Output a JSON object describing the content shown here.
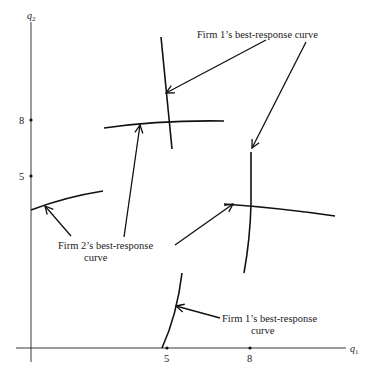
{
  "figure": {
    "axes": {
      "x_label": "q",
      "x_label_sub": "1",
      "y_label": "q",
      "y_label_sub": "2",
      "x_ticks": [
        "5",
        "8"
      ],
      "y_ticks": [
        "8",
        "5"
      ]
    },
    "annotations": {
      "firm1_top": "Firm 1’s best-response curve",
      "firm2_line1": "Firm 2’s best-response",
      "firm2_line2": "curve",
      "firm1_bottom_line1": "Firm 1’s best-response",
      "firm1_bottom_line2": "curve"
    },
    "colors": {
      "ink": "#111111",
      "background": "#ffffff"
    }
  }
}
